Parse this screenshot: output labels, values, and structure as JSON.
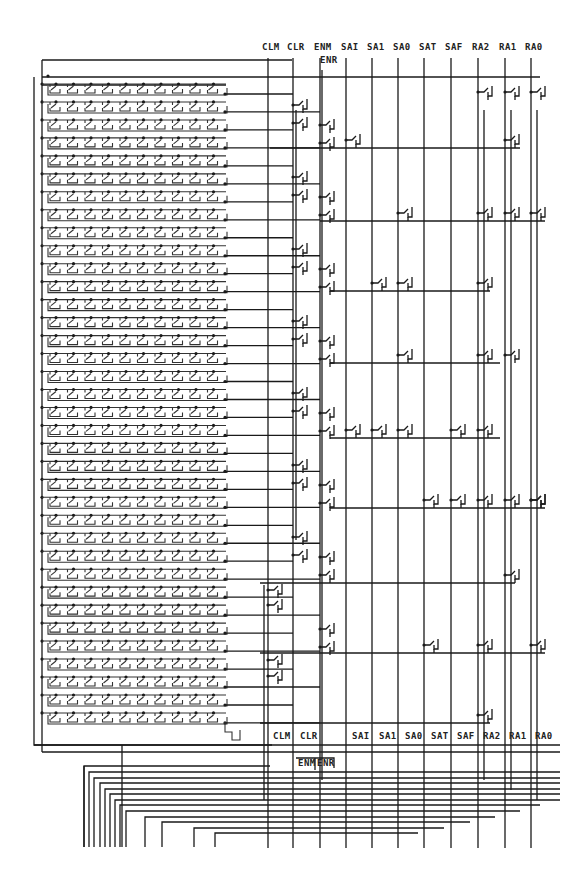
{
  "diagram": {
    "background": "#ffffff",
    "wire_color": "#1a1a1a"
  },
  "top_labels": [
    {
      "text": "CLM",
      "x": 262,
      "y": 50
    },
    {
      "text": "CLR",
      "x": 287,
      "y": 50
    },
    {
      "text": "ENM",
      "x": 314,
      "y": 50
    },
    {
      "text": "SAI",
      "x": 341,
      "y": 50
    },
    {
      "text": "SA1",
      "x": 367,
      "y": 50
    },
    {
      "text": "SA0",
      "x": 393,
      "y": 50
    },
    {
      "text": "SAT",
      "x": 419,
      "y": 50
    },
    {
      "text": "SAF",
      "x": 445,
      "y": 50
    },
    {
      "text": "RA2",
      "x": 472,
      "y": 50
    },
    {
      "text": "RA1",
      "x": 499,
      "y": 50
    },
    {
      "text": "RA0",
      "x": 525,
      "y": 50
    },
    {
      "text": "ENR",
      "x": 320,
      "y": 63
    }
  ],
  "bottom_labels": [
    {
      "text": "CLM",
      "x": 273,
      "y": 739
    },
    {
      "text": "CLR",
      "x": 300,
      "y": 739
    },
    {
      "text": "SAI",
      "x": 352,
      "y": 739
    },
    {
      "text": "SA1",
      "x": 379,
      "y": 739
    },
    {
      "text": "SA0",
      "x": 405,
      "y": 739
    },
    {
      "text": "SAT",
      "x": 431,
      "y": 739
    },
    {
      "text": "SAF",
      "x": 457,
      "y": 739
    },
    {
      "text": "RA2",
      "x": 483,
      "y": 739
    },
    {
      "text": "RA1",
      "x": 509,
      "y": 739
    },
    {
      "text": "RA0",
      "x": 535,
      "y": 739
    },
    {
      "text": "ENM",
      "x": 298,
      "y": 766
    },
    {
      "text": "ENR",
      "x": 317,
      "y": 766
    }
  ],
  "buses": [
    {
      "name": "CLM",
      "x": 268
    },
    {
      "name": "CLR",
      "x": 293
    },
    {
      "name": "ENM",
      "x": 320
    },
    {
      "name": "SAI",
      "x": 346
    },
    {
      "name": "SA1",
      "x": 372
    },
    {
      "name": "SA0",
      "x": 398
    },
    {
      "name": "SAT",
      "x": 424
    },
    {
      "name": "SAF",
      "x": 451
    },
    {
      "name": "RA2",
      "x": 478
    },
    {
      "name": "RA1",
      "x": 505
    },
    {
      "name": "RA0",
      "x": 531
    }
  ],
  "array": {
    "rows": 36,
    "cells_per_row": 10,
    "first_row_y": 94,
    "row_spacing": 17.97,
    "left_x": 42,
    "cell_start_x": 50,
    "cell_width": 17.5,
    "output_end_x": 290
  },
  "bottom_fanout": {
    "lines": 14,
    "bottom_y": 847
  }
}
